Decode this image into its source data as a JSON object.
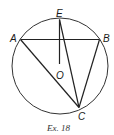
{
  "figure": {
    "caption": "Ex. 18",
    "points": {
      "A": {
        "label": "A",
        "x": 20.5,
        "y": 39.5
      },
      "B": {
        "label": "B",
        "x": 99.5,
        "y": 39.5
      },
      "C": {
        "label": "C",
        "x": 79,
        "y": 107.5
      },
      "E": {
        "label": "E",
        "x": 59.5,
        "y": 19.5
      },
      "O": {
        "label": "O",
        "x": 59.5,
        "y": 64
      }
    },
    "circle": {
      "cx": 60,
      "cy": 66,
      "r": 48
    },
    "segments": [
      "AB",
      "AC",
      "BC",
      "EC",
      "EO"
    ]
  }
}
